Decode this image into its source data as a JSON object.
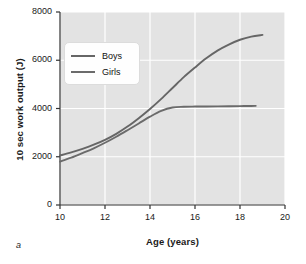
{
  "panel": {
    "label": "a"
  },
  "chart_data": {
    "type": "line",
    "title": "",
    "xlabel": "Age (years)",
    "ylabel": "10 sec work output (J)",
    "xlim": [
      10,
      20
    ],
    "ylim": [
      0,
      8000
    ],
    "xticks": [
      10,
      12,
      14,
      16,
      18,
      20
    ],
    "yticks": [
      0,
      2000,
      4000,
      6000,
      8000
    ],
    "xtick_labels": [
      "10",
      "12",
      "14",
      "16",
      "18",
      "20"
    ],
    "ytick_labels": [
      "0",
      "2000",
      "4000",
      "6000",
      "8000"
    ],
    "grid": "white gridlines on light gray plot background, vertical and horizontal at major ticks",
    "legend_position": "upper left inside axes",
    "plot_bgcolor": "#e3e3e3",
    "gridline_color": "#ffffff",
    "axis_color": "#333333",
    "series": [
      {
        "name": "Boys",
        "color": "#666666",
        "x": [
          10.0,
          10.5,
          11.0,
          11.5,
          12.0,
          12.5,
          13.0,
          13.5,
          14.0,
          14.5,
          15.0,
          15.5,
          16.0,
          16.5,
          17.0,
          17.5,
          18.0,
          18.5,
          19.0
        ],
        "values": [
          2050,
          2180,
          2330,
          2500,
          2700,
          2950,
          3250,
          3600,
          3980,
          4400,
          4850,
          5300,
          5700,
          6080,
          6400,
          6650,
          6850,
          6980,
          7050
        ]
      },
      {
        "name": "Girls",
        "color": "#6b6b6b",
        "x": [
          10.0,
          10.5,
          11.0,
          11.5,
          12.0,
          12.5,
          13.0,
          13.5,
          14.0,
          14.5,
          15.0,
          15.5,
          16.0,
          16.5,
          17.0,
          17.5,
          18.0,
          18.5,
          18.7
        ],
        "values": [
          1800,
          1960,
          2150,
          2350,
          2580,
          2830,
          3100,
          3380,
          3660,
          3900,
          4040,
          4070,
          4080,
          4085,
          4090,
          4095,
          4100,
          4105,
          4110
        ]
      }
    ]
  }
}
